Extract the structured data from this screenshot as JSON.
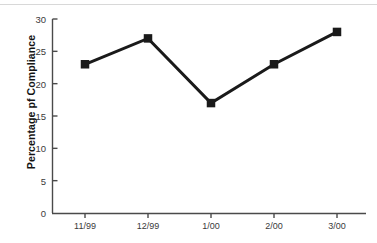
{
  "chart_data": {
    "type": "line",
    "title": "",
    "xlabel": "",
    "ylabel": "Percentage pf Compliance",
    "categories": [
      "11/99",
      "12/99",
      "1/00",
      "2/00",
      "3/00"
    ],
    "values": [
      23,
      27,
      17,
      23,
      28
    ],
    "series": [
      {
        "name": "Percentage pf Compliance",
        "values": [
          23,
          27,
          17,
          23,
          28
        ]
      }
    ],
    "ylim": [
      0,
      30
    ],
    "y_ticks": [
      0,
      5,
      10,
      15,
      20,
      25,
      30
    ],
    "y_tick_labels": [
      "0",
      "5",
      "10",
      "15",
      "20",
      "25",
      "30"
    ],
    "grid": false,
    "legend": false,
    "legend_position": "none",
    "marker": "square",
    "colors": {
      "line": "#1a1a1a",
      "marker": "#1a1a1a",
      "axis": "#4a4a4a",
      "tick_label": "#3a3a3a",
      "axis_title": "#141414",
      "background": "#ffffff",
      "top_rule": "#d8d8d8"
    }
  }
}
